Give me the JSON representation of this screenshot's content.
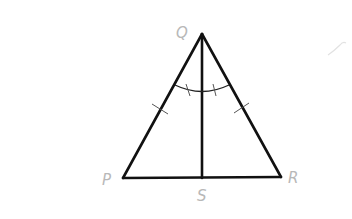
{
  "diagram": {
    "type": "geometry-triangle",
    "vertices": {
      "Q": {
        "label": "Q",
        "x": 202,
        "y": 34
      },
      "P": {
        "label": "P",
        "x": 123,
        "y": 178
      },
      "R": {
        "label": "R",
        "x": 281,
        "y": 177
      },
      "S": {
        "label": "S",
        "x": 202,
        "y": 178
      }
    },
    "segments": [
      "QP",
      "QR",
      "PR",
      "QS"
    ],
    "markings": {
      "congruent_sides": [
        "QP",
        "QR"
      ],
      "congruent_angles": [
        "PQS",
        "SQR"
      ]
    },
    "colors": {
      "line": "#111111",
      "label": "#b8b8b8",
      "tick": "#444444"
    }
  }
}
